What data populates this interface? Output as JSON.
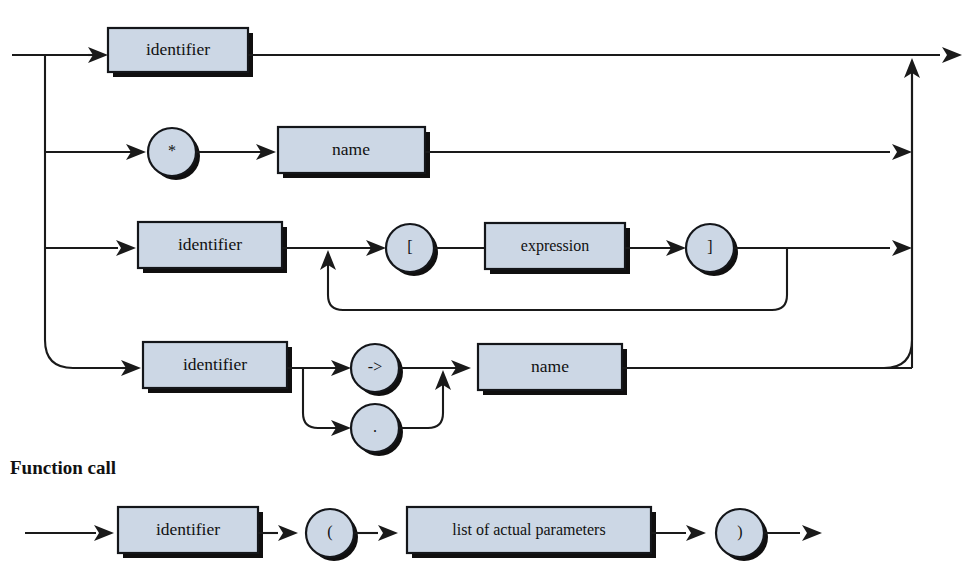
{
  "page": {
    "background_color": "#ffffff",
    "line_color": "#1a1a1a",
    "box_fill_color": "#ccd7e5",
    "box_stroke_color": "#14161a",
    "shadow_color": "#100f0f",
    "width": 979,
    "height": 581
  },
  "diagrams": [
    {
      "name": "variable-reference",
      "heading": "",
      "alternatives": [
        {
          "branch_index": 0,
          "nodes": [
            {
              "kind": "nonterminal",
              "label": "identifier"
            }
          ]
        },
        {
          "branch_index": 1,
          "nodes": [
            {
              "kind": "terminal",
              "label": "*"
            },
            {
              "kind": "nonterminal",
              "label": "name"
            }
          ]
        },
        {
          "branch_index": 2,
          "nodes": [
            {
              "kind": "nonterminal",
              "label": "identifier"
            },
            {
              "kind": "terminal",
              "label": "["
            },
            {
              "kind": "nonterminal",
              "label": "expression"
            },
            {
              "kind": "terminal",
              "label": "]"
            }
          ],
          "repeat": true
        },
        {
          "branch_index": 3,
          "nodes": [
            {
              "kind": "nonterminal",
              "label": "identifier"
            },
            {
              "kind": "terminal-choice",
              "labels": [
                "->",
                "."
              ]
            },
            {
              "kind": "nonterminal",
              "label": "name"
            }
          ]
        }
      ]
    },
    {
      "name": "function-call",
      "heading": "Function call",
      "alternatives": [
        {
          "branch_index": 0,
          "nodes": [
            {
              "kind": "nonterminal",
              "label": "identifier"
            },
            {
              "kind": "terminal",
              "label": "("
            },
            {
              "kind": "nonterminal",
              "label": "list of actual parameters"
            },
            {
              "kind": "terminal",
              "label": ")"
            }
          ]
        }
      ]
    }
  ],
  "labels": {
    "heading_function_call": "Function call",
    "identifier_row1": "identifier",
    "star": "*",
    "name_row2": "name",
    "identifier_row3": "identifier",
    "bracket_open": "[",
    "expression": "expression",
    "bracket_close": "]",
    "identifier_row4": "identifier",
    "arrow_op": "->",
    "dot_op": ".",
    "name_row4": "name",
    "identifier_fc": "identifier",
    "paren_open": "(",
    "list_of_actual_parameters": "list of actual parameters",
    "paren_close": ")"
  }
}
